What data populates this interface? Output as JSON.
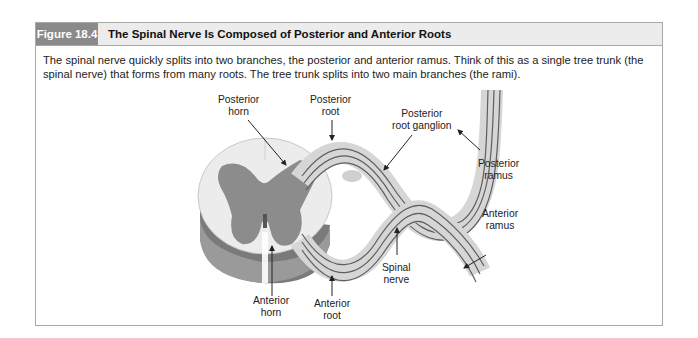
{
  "figure": {
    "number_label": "Figure 18.4",
    "title": "The Spinal Nerve Is Composed of Posterior and Anterior Roots",
    "caption": "The spinal nerve quickly splits into two branches, the posterior and anterior ramus. Think of this as a single tree trunk (the spinal nerve) that forms from many roots. The tree trunk splits into two main branches (the rami).",
    "colors": {
      "label_bg": "#8a8a8a",
      "header_bg": "#ececec",
      "border": "#a8a8a8",
      "gray_matter": "#8c8c8c",
      "white_matter": "#e6e6e6",
      "nerve_fill": "#d4d4d4",
      "nerve_fiber": "#5a5a5a"
    }
  },
  "diagram": {
    "labels": {
      "posterior_horn": [
        "Posterior",
        "horn"
      ],
      "posterior_root": [
        "Posterior",
        "root"
      ],
      "posterior_root_ganglion": [
        "Posterior",
        "root ganglion"
      ],
      "posterior_ramus": [
        "Posterior",
        "ramus"
      ],
      "anterior_ramus": [
        "Anterior",
        "ramus"
      ],
      "spinal_nerve": [
        "Spinal",
        "nerve"
      ],
      "anterior_horn": [
        "Anterior",
        "horn"
      ],
      "anterior_root": [
        "Anterior",
        "root"
      ]
    }
  }
}
